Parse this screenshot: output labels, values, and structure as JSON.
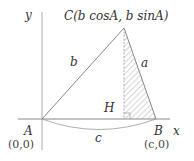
{
  "diagram": {
    "axes": {
      "x_label": "x",
      "y_label": "y"
    },
    "points": {
      "A": {
        "label": "A",
        "coord": "(0,0)"
      },
      "B": {
        "label": "B",
        "coord": "(c,0)"
      },
      "C": {
        "label": "C(b cosA, b sinA)"
      },
      "H": {
        "label": "H"
      }
    },
    "sides": {
      "a": "a",
      "b": "b",
      "c": "c"
    },
    "colors": {
      "line": "#888888",
      "text": "#333333",
      "hatch": "#999999"
    }
  }
}
